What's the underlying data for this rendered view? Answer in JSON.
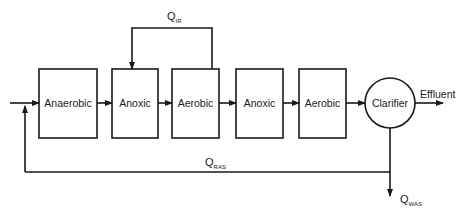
{
  "diagram": {
    "type": "process-flow",
    "units": [
      {
        "id": "anaerobic",
        "label": "Anaerobic"
      },
      {
        "id": "anoxic1",
        "label": "Anoxic"
      },
      {
        "id": "aerobic1",
        "label": "Aerobic"
      },
      {
        "id": "anoxic2",
        "label": "Anoxic"
      },
      {
        "id": "aerobic2",
        "label": "Aerobic"
      },
      {
        "id": "clarifier",
        "label": "Clarifier"
      }
    ],
    "outputs": {
      "effluent": "Effluent"
    },
    "flows": {
      "internal_recycle": {
        "main": "Q",
        "sub": "IR"
      },
      "return_sludge": {
        "main": "Q",
        "sub": "RAS"
      },
      "waste_sludge": {
        "main": "Q",
        "sub": "WAS"
      }
    },
    "colors": {
      "line": "#1a1a1a",
      "background": "#ffffff"
    }
  }
}
